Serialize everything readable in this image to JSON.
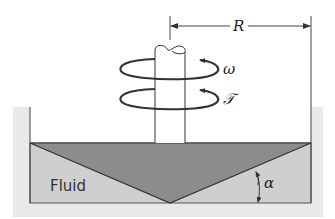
{
  "diagram": {
    "type": "cone-and-plate viscometer schematic",
    "labels": {
      "radius": "R",
      "angular_velocity": "ω",
      "torque": "𝒯",
      "angle": "α",
      "fluid": "Fluid"
    },
    "colors": {
      "outer_background": "#e9e9e9",
      "fluid": "#cfcfcf",
      "cone": "#8c8c8c",
      "lines": "#333333"
    }
  }
}
